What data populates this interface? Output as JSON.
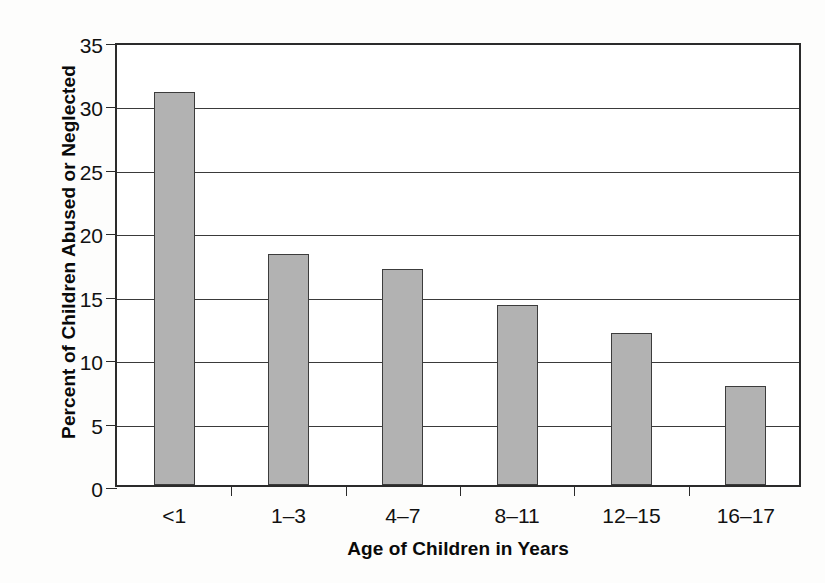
{
  "chart_data": {
    "type": "bar",
    "title": "",
    "xlabel": "Age of Children in Years",
    "ylabel": "Percent of Children Abused or Neglected",
    "categories": [
      "<1",
      "1–3",
      "4–7",
      "8–11",
      "12–15",
      "16–17"
    ],
    "values": [
      31,
      18.2,
      17,
      14.2,
      12,
      7.8
    ],
    "value_labels": [
      "31",
      "18.2",
      "17",
      "14.2",
      "12",
      "7.8"
    ],
    "ylim": [
      0,
      35
    ],
    "xlim_categories": 6,
    "yticks": [
      0,
      5,
      10,
      15,
      20,
      25,
      30,
      35
    ],
    "ytick_labels": [
      "0",
      "5",
      "10",
      "15",
      "20",
      "25",
      "30",
      "35"
    ],
    "grid": "horizontal",
    "legend": "none",
    "series": [
      {
        "name": "Percent of Children Abused or Neglected",
        "values": [
          31,
          18.2,
          17,
          14.2,
          12,
          7.8
        ]
      }
    ],
    "colors": {
      "bar_fill": "#b2b2b2",
      "bar_edge": "#3c3c3c",
      "axis": "#2b2b2b",
      "gridline": "#3a3a3a",
      "text": "#111111",
      "background": "#fdfdfc",
      "plot_background": "#ffffff"
    }
  }
}
